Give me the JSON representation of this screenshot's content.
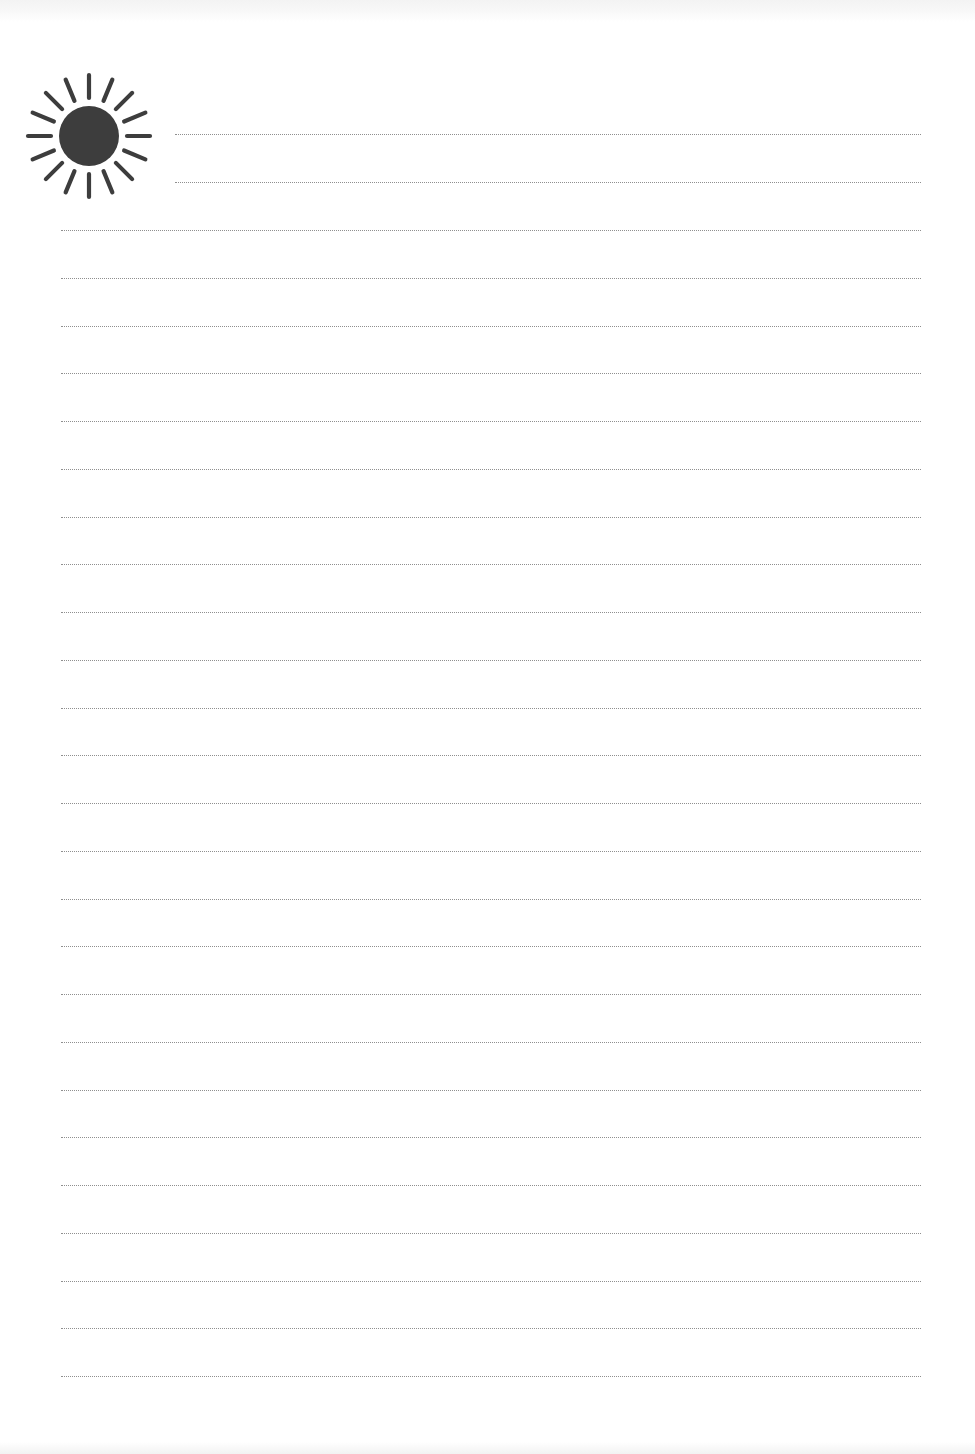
{
  "document": {
    "type": "lined-notepaper",
    "background_color": "#ffffff",
    "rule_color": "#8f8f8f",
    "rule_style": "dotted"
  },
  "header_icon": {
    "name": "sun-icon",
    "color": "#3d3d3d",
    "ray_count": 16
  },
  "lines": {
    "short": [
      {
        "y": 134,
        "x_start": 175,
        "x_end": 921
      },
      {
        "y": 182,
        "x_start": 175,
        "x_end": 921
      }
    ],
    "full": {
      "count": 25,
      "y_start": 230,
      "spacing": 47.75,
      "x_start": 61,
      "x_end": 921
    }
  }
}
